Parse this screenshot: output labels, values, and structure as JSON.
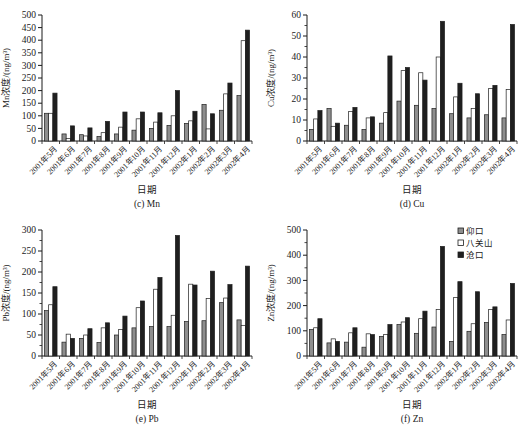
{
  "figure": {
    "background": "#ffffff",
    "text_color": "#1a1a1a",
    "axis_color": "#1a1a1a"
  },
  "legend": {
    "position": "top-right-of-zn-chart",
    "entries": [
      {
        "label": "仰口",
        "swatch": "gray-filled-square",
        "color": "#8e8e8e"
      },
      {
        "label": "八关山",
        "swatch": "open-square",
        "color": "#ffffff"
      },
      {
        "label": "沧口",
        "swatch": "black-filled-square",
        "color": "#1f1f1f"
      }
    ]
  },
  "chart_data": [
    {
      "type": "bar",
      "caption": "(c) Mn",
      "ylabel": "Mn浓度/(ng/m³)",
      "xlabel": "日期",
      "ylim": [
        0,
        500
      ],
      "ystep": 50,
      "yminor": null,
      "grid": false,
      "show_legend": false,
      "categories": [
        "2001年5月",
        "2001年6月",
        "2001年7月",
        "2001年8月",
        "2001年9月",
        "2001年10月",
        "2001年11月",
        "2001年12月",
        "2002年1月",
        "2002年2月",
        "2002年3月",
        "2002年4月"
      ],
      "series": [
        {
          "name": "仰口",
          "values": [
            110,
            28,
            25,
            18,
            28,
            43,
            50,
            62,
            70,
            145,
            122,
            180
          ]
        },
        {
          "name": "八关山",
          "values": [
            110,
            10,
            20,
            33,
            55,
            88,
            75,
            100,
            80,
            48,
            187,
            398
          ]
        },
        {
          "name": "沧口",
          "values": [
            190,
            60,
            52,
            78,
            115,
            115,
            112,
            200,
            118,
            108,
            230,
            440
          ]
        }
      ]
    },
    {
      "type": "bar",
      "caption": "(d) Cu",
      "ylabel": "Cu浓度/(ng/m³)",
      "xlabel": "日期",
      "ylim": [
        0,
        60
      ],
      "ystep": 10,
      "yminor": 5,
      "grid": false,
      "show_legend": false,
      "categories": [
        "2001年5月",
        "2001年6月",
        "2001年7月",
        "2001年8月",
        "2001年9月",
        "2001年10月",
        "2001年11月",
        "2001年12月",
        "2002年1月",
        "2002年2月",
        "2002年3月",
        "2002年4月"
      ],
      "series": [
        {
          "name": "仰口",
          "values": [
            5.5,
            15.5,
            7.5,
            5.5,
            8.5,
            19,
            17,
            15.5,
            13,
            11,
            12.5,
            11
          ]
        },
        {
          "name": "八关山",
          "values": [
            10.5,
            7,
            14,
            11,
            13.5,
            33.5,
            32.5,
            40,
            21,
            15.5,
            25,
            24.5
          ]
        },
        {
          "name": "沧口",
          "values": [
            14.5,
            8.5,
            16,
            11.5,
            40.5,
            35,
            29,
            57,
            27.5,
            22.5,
            26.5,
            55.5
          ]
        }
      ]
    },
    {
      "type": "bar",
      "caption": "(e) Pb",
      "ylabel": "Pb浓度/(ng/m³)",
      "xlabel": "日期",
      "ylim": [
        0,
        300
      ],
      "ystep": 50,
      "yminor": 25,
      "grid": false,
      "show_legend": false,
      "categories": [
        "2001年5月",
        "2001年6月",
        "2001年7月",
        "2001年8月",
        "2001年9月",
        "2001年10月",
        "2001年11月",
        "2001年12月",
        "2002年1月",
        "2002年2月",
        "2002年3月",
        "2002年4月"
      ],
      "series": [
        {
          "name": "仰口",
          "values": [
            108,
            33,
            42,
            32,
            50,
            67,
            70,
            70,
            82,
            84,
            127,
            86
          ]
        },
        {
          "name": "八关山",
          "values": [
            122,
            52,
            50,
            67,
            63,
            115,
            159,
            97,
            171,
            137,
            138,
            73
          ]
        },
        {
          "name": "沧口",
          "values": [
            165,
            42,
            65,
            79,
            95,
            131,
            187,
            287,
            169,
            202,
            170,
            214
          ]
        }
      ]
    },
    {
      "type": "bar",
      "caption": "(f) Zn",
      "ylabel": "Zn浓度/(ng/m³)",
      "xlabel": "日期",
      "ylim": [
        0,
        500
      ],
      "ystep": 100,
      "yminor": 50,
      "grid": false,
      "show_legend": true,
      "categories": [
        "2001年5月",
        "2001年6月",
        "2001年7月",
        "2001年8月",
        "2001年9月",
        "2001年10月",
        "2001年11月",
        "2001年12月",
        "2002年1月",
        "2002年2月",
        "2002年3月",
        "2002年4月"
      ],
      "series": [
        {
          "name": "仰口",
          "values": [
            105,
            52,
            55,
            35,
            78,
            125,
            90,
            115,
            58,
            98,
            133,
            85
          ]
        },
        {
          "name": "八关山",
          "values": [
            112,
            68,
            92,
            88,
            85,
            135,
            148,
            185,
            232,
            128,
            185,
            143
          ]
        },
        {
          "name": "沧口",
          "values": [
            148,
            58,
            112,
            85,
            125,
            152,
            178,
            435,
            295,
            255,
            195,
            288
          ]
        }
      ]
    }
  ],
  "series_style": {
    "colors": [
      "#8e8e8e",
      "#ffffff",
      "#1f1f1f"
    ],
    "bar_stroke": "#1f1f1f"
  }
}
